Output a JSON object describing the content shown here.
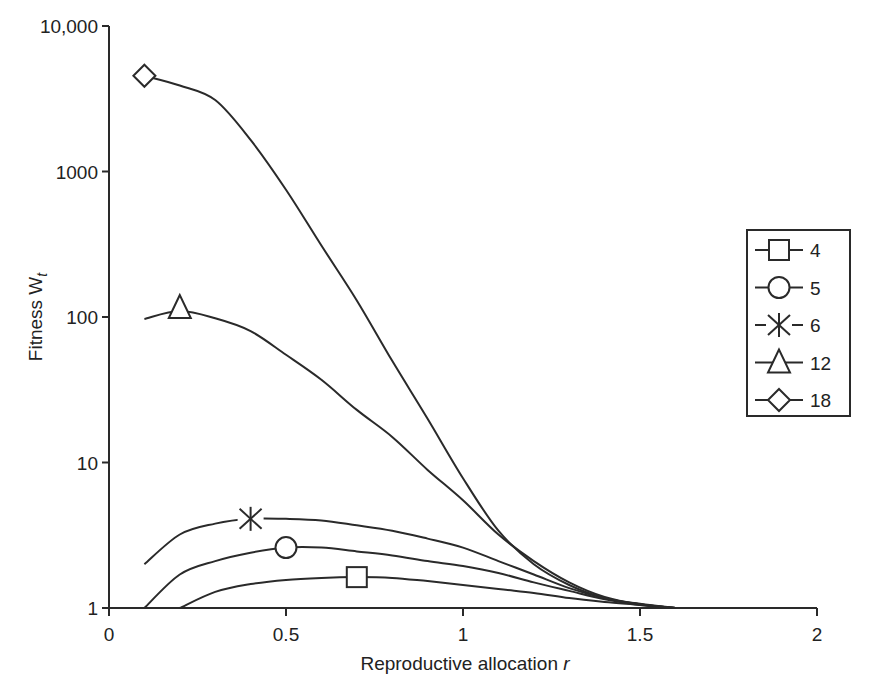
{
  "chart_data": {
    "type": "line",
    "title": "",
    "xlabel": "Reproductive allocation r",
    "xlabel_main": "Reproductive allocation ",
    "xlabel_var": "r",
    "ylabel": "Fitness W_t",
    "ylabel_main": "Fitness W",
    "ylabel_sub": "t",
    "xlim": [
      0,
      2
    ],
    "ylim": [
      1,
      10000
    ],
    "yscale": "log",
    "grid": false,
    "legend_position": "right",
    "x_ticks": [
      {
        "value": 0,
        "label": "0"
      },
      {
        "value": 0.5,
        "label": "0.5"
      },
      {
        "value": 1,
        "label": "1"
      },
      {
        "value": 1.5,
        "label": "1.5"
      },
      {
        "value": 2,
        "label": "2"
      }
    ],
    "y_ticks": [
      {
        "value": 1,
        "label": "1"
      },
      {
        "value": 10,
        "label": "10"
      },
      {
        "value": 100,
        "label": "100"
      },
      {
        "value": 1000,
        "label": "1000"
      },
      {
        "value": 10000,
        "label": "10,000"
      }
    ],
    "series": [
      {
        "name": "4",
        "marker": "square",
        "marker_at": [
          0.7,
          1.63
        ],
        "x": [
          0.2,
          0.3,
          0.4,
          0.5,
          0.6,
          0.7,
          0.8,
          0.9,
          1.0,
          1.1,
          1.2,
          1.3,
          1.4,
          1.5,
          1.6
        ],
        "values": [
          1.0,
          1.29,
          1.46,
          1.56,
          1.61,
          1.63,
          1.61,
          1.53,
          1.44,
          1.35,
          1.27,
          1.17,
          1.1,
          1.05,
          1.0
        ]
      },
      {
        "name": "5",
        "marker": "circle",
        "marker_at": [
          0.5,
          2.6
        ],
        "x": [
          0.1,
          0.2,
          0.3,
          0.4,
          0.5,
          0.6,
          0.7,
          0.8,
          0.9,
          1.0,
          1.1,
          1.2,
          1.3,
          1.4,
          1.5,
          1.6
        ],
        "values": [
          1.0,
          1.7,
          2.1,
          2.4,
          2.6,
          2.6,
          2.45,
          2.3,
          2.1,
          1.94,
          1.74,
          1.5,
          1.31,
          1.15,
          1.05,
          1.0
        ]
      },
      {
        "name": "6",
        "marker": "asterisk",
        "marker_at": [
          0.4,
          4.1
        ],
        "x": [
          0.1,
          0.2,
          0.3,
          0.4,
          0.5,
          0.6,
          0.7,
          0.8,
          0.9,
          1.0,
          1.1,
          1.2,
          1.3,
          1.4,
          1.5,
          1.6
        ],
        "values": [
          2.0,
          3.2,
          3.8,
          4.1,
          4.1,
          4.0,
          3.7,
          3.4,
          3.0,
          2.6,
          2.1,
          1.7,
          1.37,
          1.17,
          1.06,
          1.0
        ]
      },
      {
        "name": "12",
        "marker": "triangle",
        "marker_at": [
          0.2,
          110
        ],
        "x": [
          0.1,
          0.2,
          0.3,
          0.4,
          0.5,
          0.6,
          0.7,
          0.8,
          0.9,
          1.0,
          1.1,
          1.2,
          1.3,
          1.4,
          1.5,
          1.6
        ],
        "values": [
          97,
          110,
          98,
          80,
          55,
          37,
          23,
          15,
          8.9,
          5.5,
          3.2,
          2.1,
          1.5,
          1.19,
          1.06,
          1.0
        ]
      },
      {
        "name": "18",
        "marker": "diamond",
        "marker_at": [
          0.1,
          4550
        ],
        "x": [
          0.1,
          0.2,
          0.3,
          0.4,
          0.5,
          0.6,
          0.7,
          0.8,
          0.9,
          1.0,
          1.1,
          1.2,
          1.3,
          1.4,
          1.5,
          1.6
        ],
        "values": [
          4550,
          3900,
          3100,
          1650,
          750,
          310,
          130,
          50,
          20,
          7.8,
          3.4,
          2.0,
          1.44,
          1.17,
          1.07,
          1.0
        ]
      }
    ]
  }
}
